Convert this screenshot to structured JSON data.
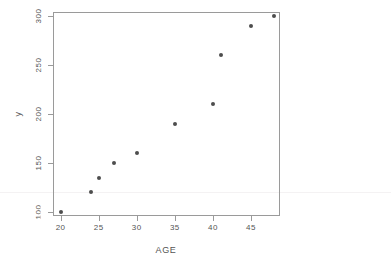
{
  "chart_data": {
    "type": "scatter",
    "title": "",
    "xlabel": "AGE",
    "ylabel": "y",
    "xlim": [
      19.0,
      48.8
    ],
    "ylim": [
      96,
      304
    ],
    "grid": false,
    "legend": null,
    "xticks": [
      20,
      25,
      30,
      35,
      40,
      45
    ],
    "xticklabels": [
      "20",
      "25",
      "30",
      "35",
      "40",
      "45"
    ],
    "yticks": [
      100,
      150,
      200,
      250,
      300
    ],
    "yticklabels": [
      "100",
      "150",
      "200",
      "250",
      "300"
    ],
    "ytick_label_rotation": -90,
    "ytick_first_label_clipped": true,
    "marker": "filled-circle",
    "marker_color": "#4d4d4d",
    "frame_color": "#9a9a9a",
    "background": "#ffffff",
    "x": [
      20,
      24,
      25,
      27,
      30,
      35,
      40,
      41,
      45,
      48
    ],
    "y": [
      100,
      120,
      135,
      150,
      160,
      190,
      210,
      260,
      290,
      300
    ],
    "points": [
      {
        "x": 20,
        "y": 100
      },
      {
        "x": 24,
        "y": 120
      },
      {
        "x": 25,
        "y": 135
      },
      {
        "x": 27,
        "y": 150
      },
      {
        "x": 30,
        "y": 160
      },
      {
        "x": 35,
        "y": 190
      },
      {
        "x": 40,
        "y": 210
      },
      {
        "x": 41,
        "y": 260
      },
      {
        "x": 45,
        "y": 290
      },
      {
        "x": 48,
        "y": 300
      }
    ]
  }
}
